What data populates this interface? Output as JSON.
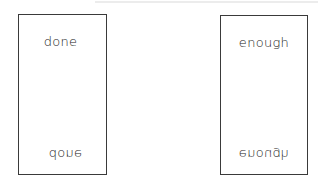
{
  "cards": [
    {
      "top_word": "done",
      "bottom_word": "done",
      "bottom_orientation": "vertically-flipped"
    },
    {
      "top_word": "enough",
      "bottom_word": "enough",
      "bottom_orientation": "vertically-flipped"
    }
  ]
}
